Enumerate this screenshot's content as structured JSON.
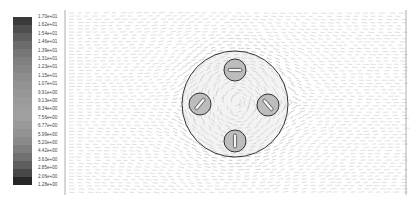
{
  "chart_data": {
    "type": "heatmap",
    "subtype": "vector-field-contour",
    "title": "",
    "xlabel": "",
    "ylabel": "",
    "colorbar": {
      "position": "left",
      "colormap": "grayscale",
      "min": 1.28,
      "max": 17.0,
      "labels": [
        "1.70e+01",
        "1.62e+01",
        "1.54e+01",
        "1.46e+01",
        "1.39e+01",
        "1.31e+01",
        "1.23e+01",
        "1.15e+01",
        "1.07e+01",
        "9.91e+00",
        "9.13e+00",
        "8.34e+00",
        "7.56e+00",
        "6.77e+00",
        "5.99e+00",
        "5.20e+00",
        "4.42e+00",
        "3.63e+00",
        "2.85e+00",
        "2.06e+00",
        "1.28e+00"
      ],
      "colors": [
        "#3a3a3a",
        "#4e4e4e",
        "#5f5f5f",
        "#6c6c6c",
        "#777777",
        "#808080",
        "#878787",
        "#8d8d8d",
        "#929292",
        "#979797",
        "#9b9b9b",
        "#9e9e9e",
        "#a0a0a0",
        "#9a9a9a",
        "#939393",
        "#8a8a8a",
        "#7e7e7e",
        "#707070",
        "#5e5e5e",
        "#474747",
        "#262626"
      ]
    },
    "geometry": {
      "outer_circle": {
        "cx": 235,
        "cy": 104,
        "r": 53
      },
      "inner_circles": [
        {
          "name": "top",
          "cx": 235,
          "cy": 70,
          "r": 11,
          "slot_angle": 0
        },
        {
          "name": "left",
          "cx": 200,
          "cy": 104,
          "r": 11,
          "slot_angle": -50
        },
        {
          "name": "right",
          "cx": 268,
          "cy": 105,
          "r": 11,
          "slot_angle": 50
        },
        {
          "name": "bottom",
          "cx": 235,
          "cy": 141,
          "r": 11,
          "slot_angle": 90
        }
      ]
    },
    "plot_frame": {
      "left": 65,
      "right": 406,
      "top": 10,
      "bottom": 195
    }
  }
}
